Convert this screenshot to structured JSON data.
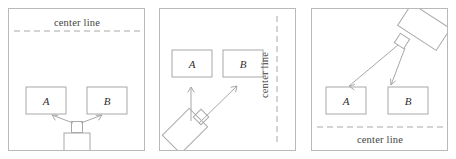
{
  "figure": {
    "background_color": "#ffffff",
    "stroke_color": "#9a9a9a",
    "panel_border_color": "#b9b9b9",
    "text_color": "#3f3f3f",
    "panels": [
      {
        "id": "panel-1",
        "name": "robot-facing-up-center-line-top",
        "center_line": {
          "label": "center line",
          "orientation": "horizontal",
          "position": "top",
          "label_x": 68,
          "label_y": 13,
          "line_y": 22,
          "line_x1": 5,
          "line_x2": 132
        },
        "boxes": [
          {
            "label": "A",
            "x": 17,
            "y": 78,
            "w": 40,
            "h": 27
          },
          {
            "label": "B",
            "x": 78,
            "y": 78,
            "w": 40,
            "h": 27
          }
        ],
        "robot": {
          "body_cx": 68,
          "body_cy": 134,
          "body_w": 26,
          "body_h": 20,
          "rotation_deg": 0,
          "turret_cx": 68,
          "turret_cy": 118,
          "turret_size": 11
        },
        "arrows": [
          {
            "name": "arrow-to-a",
            "x1": 64,
            "y1": 114,
            "x2": 42,
            "y2": 105
          },
          {
            "name": "arrow-to-b",
            "x1": 72,
            "y1": 114,
            "x2": 94,
            "y2": 105
          }
        ]
      },
      {
        "id": "panel-2",
        "name": "robot-rotated-left-center-line-right",
        "center_line": {
          "label": "center line",
          "orientation": "vertical",
          "position": "right",
          "label_x": 104,
          "label_y": 66,
          "line_x": 117,
          "line_y1": 7,
          "line_y2": 136
        },
        "boxes": [
          {
            "label": "A",
            "x": 12,
            "y": 41,
            "w": 40,
            "h": 27
          },
          {
            "label": "B",
            "x": 63,
            "y": 41,
            "w": 40,
            "h": 27
          }
        ],
        "robot": {
          "body_cx": 25,
          "body_cy": 122,
          "body_w": 38,
          "body_h": 26,
          "rotation_deg": -45,
          "turret_cx": 41,
          "turret_cy": 108,
          "turret_size": 11
        },
        "arrows": [
          {
            "name": "arrow-vertical-to-a",
            "x1": 31,
            "y1": 110,
            "x2": 31,
            "y2": 78
          },
          {
            "name": "arrow-diagonal-to-b",
            "x1": 39,
            "y1": 113,
            "x2": 77,
            "y2": 76
          }
        ]
      },
      {
        "id": "panel-3",
        "name": "robot-rotated-right-center-line-bottom",
        "center_line": {
          "label": "center line",
          "orientation": "horizontal",
          "position": "bottom",
          "label_x": 68,
          "label_y": 130,
          "line_y": 118,
          "line_x1": 5,
          "line_x2": 132
        },
        "boxes": [
          {
            "label": "A",
            "x": 14,
            "y": 78,
            "w": 40,
            "h": 27
          },
          {
            "label": "B",
            "x": 76,
            "y": 78,
            "w": 40,
            "h": 27
          }
        ],
        "robot": {
          "body_cx": 112,
          "body_cy": 18,
          "body_w": 46,
          "body_h": 26,
          "rotation_deg": 33,
          "turret_cx": 90,
          "turret_cy": 32,
          "turret_size": 11
        },
        "arrows": [
          {
            "name": "arrow-to-a",
            "x1": 86,
            "y1": 36,
            "x2": 37,
            "y2": 77
          },
          {
            "name": "arrow-to-b",
            "x1": 92,
            "y1": 38,
            "x2": 79,
            "y2": 76
          }
        ]
      }
    ]
  }
}
